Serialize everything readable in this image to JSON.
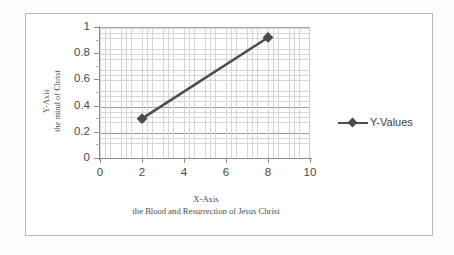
{
  "chart_data": {
    "type": "line",
    "title": "",
    "xlabel": "X-Axis",
    "xlabel_sub": "the Blood and Resurrection of Jesus Christ",
    "ylabel": "Y-Axis",
    "ylabel_sub": "the mind of Christ",
    "xlim": [
      0,
      10
    ],
    "ylim": [
      0,
      1
    ],
    "xticks": [
      "0",
      "2",
      "4",
      "6",
      "8",
      "10"
    ],
    "yticks": [
      "0",
      "0.2",
      "0.4",
      "0.6",
      "0.8",
      "1"
    ],
    "grid": "major and minor gridlines",
    "legend_position": "right",
    "series": [
      {
        "name": "Y-Values",
        "x": [
          2,
          8
        ],
        "values": [
          0.3,
          0.92
        ],
        "line_color": "#4d4d4d",
        "marker": "diamond",
        "marker_color": "#4a4a4a"
      }
    ]
  },
  "legend": {
    "entries": [
      {
        "label": "Y-Values"
      }
    ]
  },
  "colors": {
    "series_line": "#4d4d4d",
    "gridline_major": "#9a9a9a",
    "gridline_minor": "#d6d6d6",
    "axis": "#8d8d8d",
    "frame_border": "#b9b9b9",
    "text": "#4a4a4a"
  }
}
